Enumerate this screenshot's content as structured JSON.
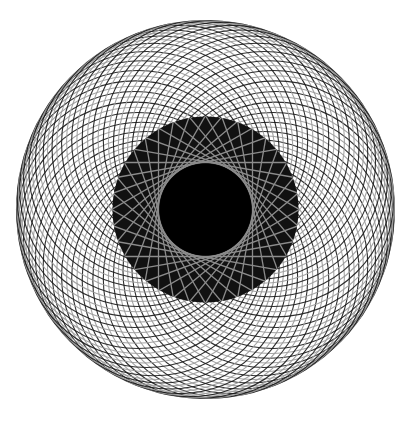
{
  "canvas": {
    "width": 411,
    "height": 423,
    "background": "#ffffff"
  },
  "pattern": {
    "type": "spirograph-offset-circles",
    "center": [
      205.5,
      209.5
    ],
    "outer_radius": 189,
    "circle_radius": 118,
    "offset_radius": 71,
    "circle_count": 84,
    "stroke_width": 1.1,
    "colors": [
      "#1a1a1a",
      "#9a9a9a"
    ],
    "inner_ring": {
      "radius": 93,
      "fill": "#111111",
      "tangent_line_count": 36,
      "tangent_circle_radius": 47,
      "line_color": "#8c8c8c",
      "line_width": 1.3
    },
    "core": {
      "radius": 46,
      "fill": "#000000"
    }
  }
}
